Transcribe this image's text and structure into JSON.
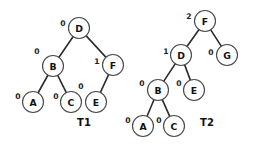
{
  "figure": {
    "type": "diagram",
    "subtype": "binary-search-tree-pair",
    "background_color": "#ffffff",
    "node_fill_color": "#ffffff",
    "node_stroke_color": "#4a4a4a",
    "edge_color": "#2b2b2b",
    "text_color": "#111111",
    "width": 260,
    "height": 150
  },
  "trees": [
    {
      "id": "T1",
      "caption": "T1",
      "caption_pos": {
        "x": 84,
        "y": 122
      },
      "root": "D",
      "nodes": [
        {
          "key": "D",
          "label": "D",
          "balance": "0",
          "x": 79,
          "y": 28,
          "r": 10.5,
          "balance_pos": {
            "x": 63,
            "y": 23
          }
        },
        {
          "key": "B",
          "label": "B",
          "balance": "0",
          "x": 53,
          "y": 66,
          "r": 10.5,
          "balance_pos": {
            "x": 37,
            "y": 51
          }
        },
        {
          "key": "F",
          "label": "F",
          "balance": "1",
          "x": 113,
          "y": 65,
          "r": 10.5,
          "balance_pos": {
            "x": 97,
            "y": 61
          }
        },
        {
          "key": "A",
          "label": "A",
          "balance": "0",
          "x": 33,
          "y": 102,
          "r": 10.5,
          "balance_pos": {
            "x": 18,
            "y": 96
          }
        },
        {
          "key": "C",
          "label": "C",
          "balance": "0",
          "x": 71,
          "y": 102,
          "r": 10.5,
          "balance_pos": {
            "x": 56,
            "y": 96
          }
        },
        {
          "key": "E",
          "label": "E",
          "balance": "0",
          "x": 96,
          "y": 102,
          "r": 10.5,
          "balance_pos": {
            "x": 81,
            "y": 86
          }
        }
      ],
      "edges": [
        {
          "from": "D",
          "to": "B"
        },
        {
          "from": "D",
          "to": "F"
        },
        {
          "from": "B",
          "to": "A"
        },
        {
          "from": "B",
          "to": "C"
        },
        {
          "from": "F",
          "to": "E"
        }
      ]
    },
    {
      "id": "T2",
      "caption": "T2",
      "caption_pos": {
        "x": 207,
        "y": 122
      },
      "root": "F",
      "nodes": [
        {
          "key": "F",
          "label": "F",
          "balance": "2",
          "x": 205,
          "y": 21,
          "r": 10.5,
          "balance_pos": {
            "x": 189,
            "y": 16
          }
        },
        {
          "key": "D",
          "label": "D",
          "balance": "1",
          "x": 181,
          "y": 55,
          "r": 10.5,
          "balance_pos": {
            "x": 166,
            "y": 51
          }
        },
        {
          "key": "G",
          "label": "G",
          "balance": "0",
          "x": 227,
          "y": 55,
          "r": 10.5,
          "balance_pos": {
            "x": 211,
            "y": 52
          }
        },
        {
          "key": "B",
          "label": "B",
          "balance": "0",
          "x": 158,
          "y": 90,
          "r": 10.5,
          "balance_pos": {
            "x": 142,
            "y": 83
          }
        },
        {
          "key": "E",
          "label": "E",
          "balance": "0",
          "x": 194,
          "y": 90,
          "r": 10.5,
          "balance_pos": {
            "x": 179,
            "y": 83
          }
        },
        {
          "key": "A",
          "label": "A",
          "balance": "0",
          "x": 143,
          "y": 126,
          "r": 10.5,
          "balance_pos": {
            "x": 128,
            "y": 120
          }
        },
        {
          "key": "C",
          "label": "C",
          "balance": "0",
          "x": 174,
          "y": 126,
          "r": 10.5,
          "balance_pos": {
            "x": 159,
            "y": 120
          }
        }
      ],
      "edges": [
        {
          "from": "F",
          "to": "D"
        },
        {
          "from": "F",
          "to": "G"
        },
        {
          "from": "D",
          "to": "B"
        },
        {
          "from": "D",
          "to": "E"
        },
        {
          "from": "B",
          "to": "A"
        },
        {
          "from": "B",
          "to": "C"
        }
      ]
    }
  ]
}
